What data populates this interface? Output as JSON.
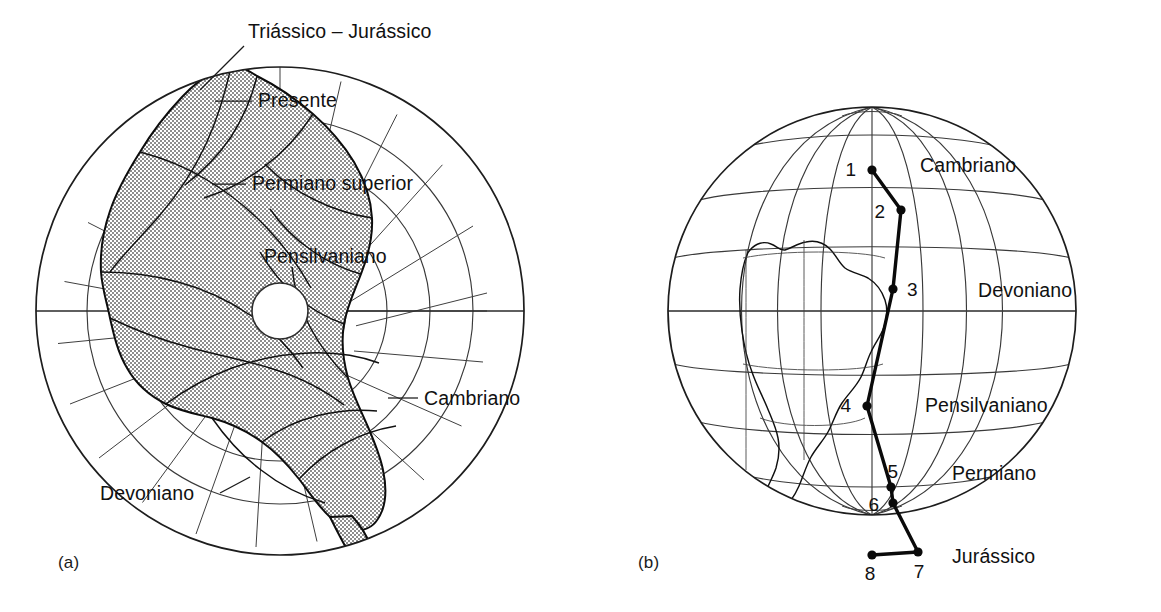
{
  "figure": {
    "panels": [
      {
        "id": "a",
        "caption": "(a)",
        "kind": "polar-stereographic-reconstruction"
      },
      {
        "id": "b",
        "caption": "(b)",
        "kind": "orthographic-globe-polar-wander"
      }
    ]
  },
  "panel_a": {
    "caption": "(a)",
    "ring_labels": [
      {
        "text": "Triássico – Jurássico",
        "x": 248,
        "y": 38,
        "anchor": "start",
        "leader": [
          [
            244,
            46
          ],
          [
            200,
            86
          ]
        ]
      },
      {
        "text": "Presente",
        "x": 258,
        "y": 107,
        "anchor": "start",
        "leader": [
          [
            252,
            101
          ],
          [
            215,
            101
          ]
        ]
      },
      {
        "text": "Permiano superior",
        "x": 252,
        "y": 190,
        "anchor": "start",
        "leader": [
          [
            246,
            184
          ],
          [
            212,
            184
          ]
        ]
      },
      {
        "text": "Pensilvaniano",
        "x": 264,
        "y": 263,
        "anchor": "start",
        "leader": null
      },
      {
        "text": "Cambriano",
        "x": 424,
        "y": 405,
        "anchor": "start",
        "leader": [
          [
            418,
            398
          ],
          [
            388,
            398
          ]
        ]
      },
      {
        "text": "Devoniano",
        "x": 100,
        "y": 500,
        "anchor": "start",
        "leader": [
          [
            218,
            493
          ],
          [
            248,
            478
          ]
        ]
      }
    ],
    "geometry": {
      "center_x": 280,
      "center_y": 311,
      "outer_radius": 244,
      "inner_hole_radius": 28,
      "ring_radii": [
        28,
        66,
        107,
        150,
        193,
        244
      ],
      "meridian_count": 18
    }
  },
  "panel_b": {
    "caption": "(b)",
    "era_labels": [
      {
        "text": "Cambriano",
        "x": 340,
        "y": 165,
        "anchor": "start"
      },
      {
        "text": "Devoniano",
        "x": 398,
        "y": 291,
        "anchor": "start"
      },
      {
        "text": "Pensilvaniano",
        "x": 345,
        "y": 404,
        "anchor": "start"
      },
      {
        "text": "Permiano",
        "x": 372,
        "y": 473,
        "anchor": "start"
      },
      {
        "text": "Jurássico",
        "x": 372,
        "y": 556,
        "anchor": "start"
      }
    ],
    "geometry": {
      "center_x": 292,
      "center_y": 311,
      "radius": 204,
      "parallel_step_deg": 20,
      "meridian_step_deg": 20
    },
    "polar_wander_path": {
      "name": "Curva de deriva polar aparente",
      "points": [
        {
          "label": "1",
          "x": 292,
          "y": 170,
          "lx": 276,
          "ly": 176,
          "era": "Cambriano"
        },
        {
          "label": "2",
          "x": 321,
          "y": 210,
          "lx": 305,
          "ly": 218,
          "era": ""
        },
        {
          "label": "3",
          "x": 313,
          "y": 289,
          "lx": 327,
          "ly": 296,
          "era": "Devoniano"
        },
        {
          "label": "4",
          "x": 287,
          "y": 406,
          "lx": 271,
          "ly": 412,
          "era": "Pensilvaniano"
        },
        {
          "label": "5",
          "x": 311,
          "y": 487,
          "lx": 318,
          "ly": 478,
          "era": "Permiano"
        },
        {
          "label": "6",
          "x": 313,
          "y": 503,
          "lx": 299,
          "ly": 511,
          "era": ""
        },
        {
          "label": "7",
          "x": 338,
          "y": 552,
          "lx": 339,
          "ly": 575,
          "era": "Jurássico"
        },
        {
          "label": "8",
          "x": 292,
          "y": 555,
          "lx": 290,
          "ly": 580,
          "era": ""
        }
      ]
    }
  },
  "style": {
    "ink": "#111111",
    "grid_stroke": "#3a3a3a",
    "continent_fill": "#9a9a9a",
    "background": "#ffffff"
  }
}
